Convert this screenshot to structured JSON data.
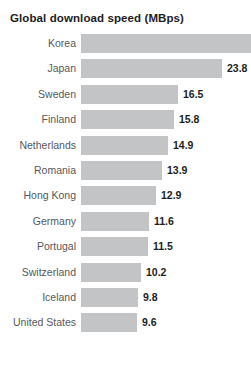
{
  "chart_data": {
    "type": "bar",
    "title": "Global download speed (MBps)",
    "xlabel": "",
    "ylabel": "",
    "orientation": "horizontal",
    "grid": false,
    "legend": null,
    "xlim": [
      0,
      29
    ],
    "bar_color": "#c3c4c5",
    "label_color": "#55595c",
    "value_color": "#1d1d1d",
    "categories": [
      "Korea",
      "Japan",
      "Sweden",
      "Finland",
      "Netherlands",
      "Romania",
      "Hong Kong",
      "Germany",
      "Portugal",
      "Switzerland",
      "Iceland",
      "United States"
    ],
    "values": [
      28.8,
      23.8,
      16.5,
      15.8,
      14.9,
      13.9,
      12.9,
      11.6,
      11.5,
      10.2,
      9.8,
      9.6
    ],
    "value_labels": [
      "",
      "23.8",
      "16.5",
      "15.8",
      "14.9",
      "13.9",
      "12.9",
      "11.6",
      "11.5",
      "10.2",
      "9.8",
      "9.6"
    ]
  },
  "rows": [
    {
      "label": "Korea",
      "value_label": "",
      "bar_px": 178,
      "value_x": 0
    },
    {
      "label": "Japan",
      "value_label": "23.8",
      "bar_px": 141,
      "value_x": 146
    },
    {
      "label": "Sweden",
      "value_label": "16.5",
      "bar_px": 97,
      "value_x": 102
    },
    {
      "label": "Finland",
      "value_label": "15.8",
      "bar_px": 93,
      "value_x": 98
    },
    {
      "label": "Netherlands",
      "value_label": "14.9",
      "bar_px": 87,
      "value_x": 92
    },
    {
      "label": "Romania",
      "value_label": "13.9",
      "bar_px": 81,
      "value_x": 86
    },
    {
      "label": "Hong Kong",
      "value_label": "12.9",
      "bar_px": 75,
      "value_x": 80
    },
    {
      "label": "Germany",
      "value_label": "11.6",
      "bar_px": 68,
      "value_x": 73
    },
    {
      "label": "Portugal",
      "value_label": "11.5",
      "bar_px": 67,
      "value_x": 72
    },
    {
      "label": "Switzerland",
      "value_label": "10.2",
      "bar_px": 60,
      "value_x": 65
    },
    {
      "label": "Iceland",
      "value_label": "9.8",
      "bar_px": 57,
      "value_x": 62
    },
    {
      "label": "United States",
      "value_label": "9.6",
      "bar_px": 56,
      "value_x": 61
    }
  ]
}
